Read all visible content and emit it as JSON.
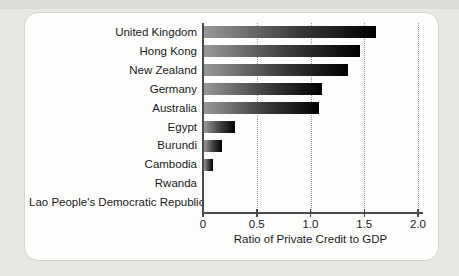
{
  "chart_data": {
    "type": "bar",
    "orientation": "horizontal",
    "title": "",
    "xlabel": "Ratio of Private Credit to GDP",
    "ylabel": "",
    "categories": [
      "United Kingdom",
      "Hong Kong",
      "New Zealand",
      "Germany",
      "Australia",
      "Egypt",
      "Burundi",
      "Cambodia",
      "Rwanda",
      "Lao People's Democratic Republic"
    ],
    "values": [
      1.6,
      1.45,
      1.34,
      1.1,
      1.07,
      0.29,
      0.17,
      0.08,
      0.0,
      0.0
    ],
    "xlim": [
      0,
      2.0
    ],
    "xticks": [
      0,
      0.5,
      1.0,
      1.5,
      2.0
    ],
    "xtick_labels": [
      "0",
      "0.5",
      "1.0",
      "1.5",
      "2.0"
    ],
    "gridline_values": [
      0.5,
      1.0,
      1.5,
      2.0
    ],
    "grid": "dotted-vertical",
    "legend": "none"
  },
  "colors": {
    "background": "#e9e8e5",
    "top_strip": "#dcdbd8",
    "card": "#fdfdfc",
    "card_border": "#d6d5d2",
    "axis": "#4a4a4a",
    "gridline": "#9a9a9a",
    "text": "#1a1a1a",
    "bar_gradient_start": "#989898",
    "bar_gradient_mid": "#3a3a3a",
    "bar_gradient_end": "#000000"
  }
}
